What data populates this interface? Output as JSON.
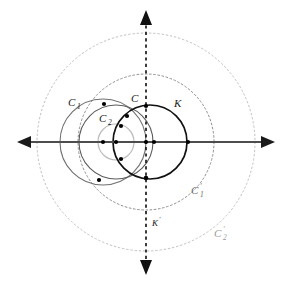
{
  "figure": {
    "background_color": "#ffffff",
    "width": 291,
    "height": 285
  },
  "axes": {
    "horizontal": {
      "name": "horizontal-axis",
      "style": "solid",
      "color": "#4d4d4d",
      "y": 142,
      "x_start": 17,
      "x_end": 275,
      "arrow_left": true,
      "arrow_right": true
    },
    "vertical": {
      "name": "vertical-axis",
      "style": "dashed",
      "color": "#1a1a1a",
      "x": 146,
      "y_start": 10,
      "y_end": 275,
      "arrow_top": true,
      "arrow_bottom": true,
      "label": "K'"
    }
  },
  "circles": [
    {
      "id": "C2p",
      "label": "C'₂",
      "label_text": "C",
      "label_sub": "2",
      "label_prime": "′",
      "cx": 146,
      "cy": 142,
      "r": 109,
      "style": "dotted",
      "color": "#bdbdbd",
      "stroke_width": 1,
      "label_x": 228,
      "label_y": 235
    },
    {
      "id": "C1p",
      "label": "C'₁",
      "label_text": "C",
      "label_sub": "1",
      "label_prime": "′",
      "cx": 146,
      "cy": 142,
      "r": 68,
      "style": "dotted",
      "color": "#8c8c8c",
      "stroke_width": 1,
      "label_x": 196,
      "label_y": 193
    },
    {
      "id": "C1",
      "label": "C₁",
      "label_text": "C",
      "label_sub": "1",
      "label_prime": "",
      "cx": 103,
      "cy": 142,
      "r": 43,
      "style": "solid",
      "color": "#6f6f6f",
      "stroke_width": 1.1,
      "label_x": 71,
      "label_y": 104
    },
    {
      "id": "C",
      "label": "C",
      "label_text": "C",
      "label_sub": "",
      "label_prime": "",
      "cx": 116,
      "cy": 142,
      "r": 37,
      "style": "solid",
      "color": "#595959",
      "stroke_width": 1.1,
      "label_x": 132,
      "label_y": 100
    },
    {
      "id": "C2",
      "label": "C₂",
      "label_text": "C",
      "label_sub": "2",
      "label_prime": "",
      "cx": 116,
      "cy": 142,
      "r": 18,
      "style": "solid",
      "color": "#b5b5b5",
      "stroke_width": 1.1,
      "label_x": 102,
      "label_y": 120
    },
    {
      "id": "K",
      "label": "K",
      "label_text": "K",
      "label_sub": "",
      "label_prime": "",
      "cx": 150,
      "cy": 142,
      "r": 37,
      "style": "solid",
      "color": "#111111",
      "stroke_width": 1.6,
      "label_x": 176,
      "label_y": 105
    }
  ],
  "points": [
    {
      "name": "center-C1",
      "x": 103,
      "y": 142
    },
    {
      "name": "center-C2",
      "x": 116,
      "y": 142
    },
    {
      "name": "center-K-left",
      "x": 146,
      "y": 142
    },
    {
      "name": "center-K",
      "x": 153,
      "y": 142
    },
    {
      "name": "intersection-upper-left",
      "x": 104,
      "y": 104
    },
    {
      "name": "intersection-lower-left",
      "x": 99,
      "y": 180
    },
    {
      "name": "intersection-upper-inner",
      "x": 127,
      "y": 116
    },
    {
      "name": "intersection-mid-inner",
      "x": 121,
      "y": 126
    },
    {
      "name": "intersection-lower-inner",
      "x": 121,
      "y": 159
    },
    {
      "name": "intersection-bottom-axis",
      "x": 146,
      "y": 178
    },
    {
      "name": "intersection-top-axis",
      "x": 146,
      "y": 106
    },
    {
      "name": "intersection-right-axis",
      "x": 188,
      "y": 142
    }
  ],
  "labels": {
    "C1": "C",
    "C1_sub": "1",
    "C2": "C",
    "C2_sub": "2",
    "C": "C",
    "K": "K",
    "C1p": "C",
    "C1p_sub": "1",
    "C1p_prime": "′",
    "C2p": "C",
    "C2p_sub": "2",
    "C2p_prime": "′",
    "Kp": "K",
    "Kp_prime": "′"
  }
}
